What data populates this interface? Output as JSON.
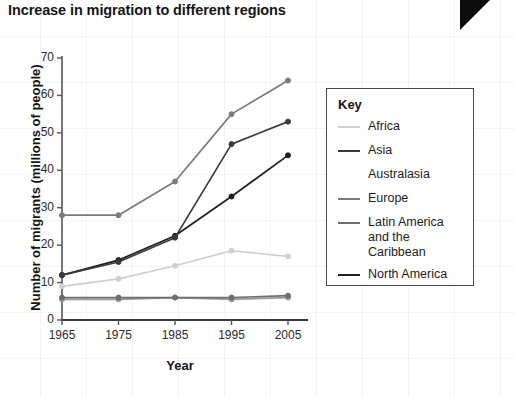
{
  "title": "Increase in migration to different regions",
  "legend": {
    "title": "Key",
    "items": [
      {
        "label": "Africa",
        "color": "#cfcfcf",
        "has_swatch": true
      },
      {
        "label": "Asia",
        "color": "#3b3b3b",
        "has_swatch": true
      },
      {
        "label": "Australasia",
        "color": "#9a9a9a",
        "has_swatch": false
      },
      {
        "label": "Europe",
        "color": "#7a7a7a",
        "has_swatch": true
      },
      {
        "label": "Latin America\nand the Caribbean",
        "color": "#6e6e6e",
        "has_swatch": true
      },
      {
        "label": "North America",
        "color": "#1f1f1f",
        "has_swatch": true
      }
    ]
  },
  "chart_data": {
    "type": "line",
    "title": "Increase in migration to different regions",
    "xlabel": "Year",
    "ylabel": "Number of migrants (millions of people)",
    "categories": [
      1965,
      1975,
      1985,
      1995,
      2005
    ],
    "x_tick_labels": [
      "1965",
      "1975",
      "1985",
      "1995",
      "2005"
    ],
    "y_tick_labels": [
      "0",
      "10",
      "20",
      "30",
      "40",
      "50",
      "60",
      "70"
    ],
    "y_ticks": [
      0,
      10,
      20,
      30,
      40,
      50,
      60,
      70
    ],
    "ylim": [
      0,
      70
    ],
    "grid": false,
    "legend_position": "right",
    "markers": true,
    "series": [
      {
        "name": "Africa",
        "color": "#cfcfcf",
        "values": [
          9,
          11,
          14.5,
          18.5,
          17
        ]
      },
      {
        "name": "Asia",
        "color": "#3b3b3b",
        "values": [
          12,
          15.5,
          22,
          47,
          53
        ]
      },
      {
        "name": "Australasia",
        "color": "#9a9a9a",
        "values": [
          5.5,
          5.5,
          6,
          5.5,
          6
        ]
      },
      {
        "name": "Europe",
        "color": "#7a7a7a",
        "values": [
          28,
          28,
          37,
          55,
          64
        ]
      },
      {
        "name": "Latin America and the Caribbean",
        "color": "#6e6e6e",
        "values": [
          6,
          6,
          6,
          6,
          6.5
        ]
      },
      {
        "name": "North America",
        "color": "#1f1f1f",
        "values": [
          12,
          16,
          22.5,
          33,
          44
        ]
      }
    ]
  }
}
